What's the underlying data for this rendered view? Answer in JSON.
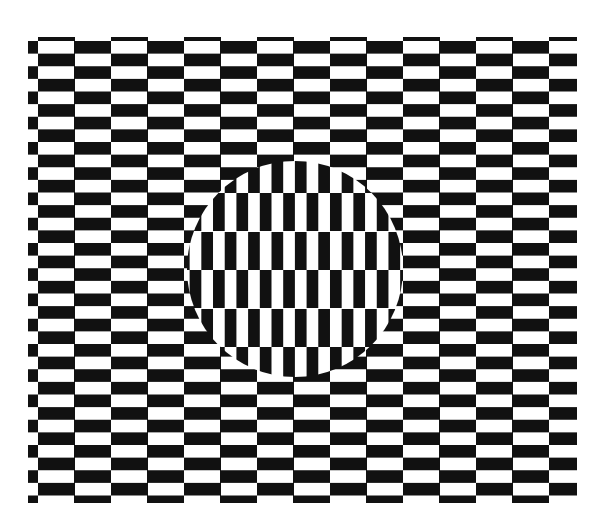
{
  "figure": {
    "title": "",
    "colors": {
      "dark": "#111111",
      "light": "#ffffff"
    },
    "outer_pattern": {
      "orientation": "horizontal",
      "brick_width": 36.5,
      "brick_height": 12.6,
      "region": {
        "x": 28,
        "y": 37,
        "width": 549,
        "height": 466
      }
    },
    "inner_disc": {
      "orientation": "vertical",
      "brick_width": 11.7,
      "brick_height": 38.5,
      "center": {
        "x": 295,
        "y": 269
      },
      "radius": 108
    }
  }
}
